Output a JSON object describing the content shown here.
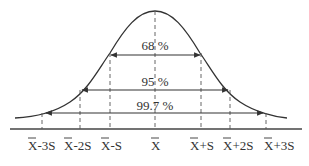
{
  "diagram": {
    "colors": {
      "line": "#333333",
      "background": "#ffffff"
    },
    "axis_labels": [
      {
        "id": "m3s",
        "bar": "X",
        "suffix": "-3S"
      },
      {
        "id": "m2s",
        "bar": "X",
        "suffix": "-2S"
      },
      {
        "id": "m1s",
        "bar": "X",
        "suffix": "-S"
      },
      {
        "id": "mean",
        "bar": "X",
        "suffix": ""
      },
      {
        "id": "p1s",
        "bar": "X",
        "suffix": "+S"
      },
      {
        "id": "p2s",
        "bar": "X",
        "suffix": "+2S"
      },
      {
        "id": "p3s",
        "bar": "X",
        "suffix": "+3S"
      }
    ],
    "intervals": [
      {
        "label": "68 %",
        "range": "X̄-S to X̄+S"
      },
      {
        "label": "95 %",
        "range": "X̄-2S to X̄+2S"
      },
      {
        "label": "99.7 %",
        "range": "X̄-3S to X̄+3S"
      }
    ]
  }
}
